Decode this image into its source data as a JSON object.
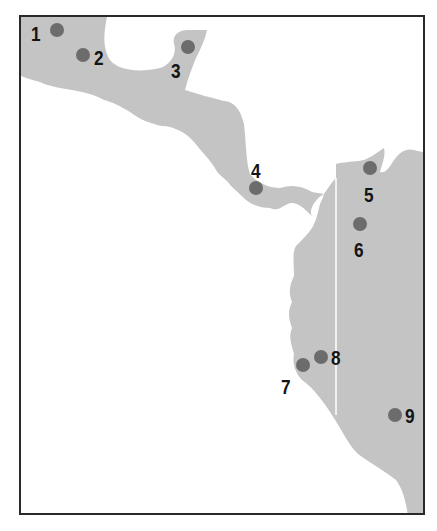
{
  "map": {
    "colors": {
      "land": "#c4c4c4",
      "water": "#ffffff",
      "border": "#2a2a2a",
      "dot": "#6c6c6c",
      "divider": "#ffffff",
      "label": "#141414"
    },
    "sites": [
      {
        "id": "1",
        "label": "1",
        "dot": {
          "x": 57,
          "y": 30
        },
        "text": {
          "x": 31,
          "y": 23
        }
      },
      {
        "id": "2",
        "label": "2",
        "dot": {
          "x": 83,
          "y": 55
        },
        "text": {
          "x": 94,
          "y": 47
        }
      },
      {
        "id": "3",
        "label": "3",
        "dot": {
          "x": 188,
          "y": 47
        },
        "text": {
          "x": 171,
          "y": 60
        }
      },
      {
        "id": "4",
        "label": "4",
        "dot": {
          "x": 256,
          "y": 188
        },
        "text": {
          "x": 251,
          "y": 160
        }
      },
      {
        "id": "5",
        "label": "5",
        "dot": {
          "x": 370,
          "y": 168
        },
        "text": {
          "x": 364,
          "y": 184
        }
      },
      {
        "id": "6",
        "label": "6",
        "dot": {
          "x": 360,
          "y": 224
        },
        "text": {
          "x": 354,
          "y": 239
        }
      },
      {
        "id": "7",
        "label": "7",
        "dot": {
          "x": 303,
          "y": 365
        },
        "text": {
          "x": 281,
          "y": 376
        }
      },
      {
        "id": "8",
        "label": "8",
        "dot": {
          "x": 321,
          "y": 357
        },
        "text": {
          "x": 331,
          "y": 347
        }
      },
      {
        "id": "9",
        "label": "9",
        "dot": {
          "x": 395,
          "y": 415
        },
        "text": {
          "x": 405,
          "y": 405
        }
      }
    ]
  }
}
